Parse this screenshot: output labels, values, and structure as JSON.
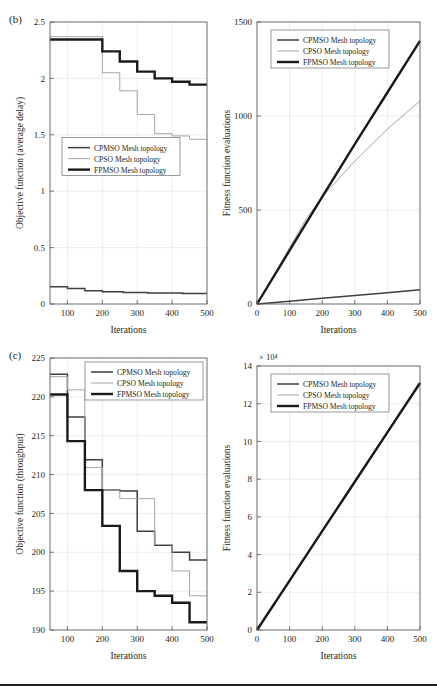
{
  "figure": {
    "panels": [
      {
        "id": "b",
        "label": "(b)",
        "charts": [
          "b-left",
          "b-right"
        ]
      },
      {
        "id": "c",
        "label": "(c)",
        "charts": [
          "c-left",
          "c-right"
        ]
      }
    ]
  },
  "series_styles": {
    "CPMSO Mesh topology": {
      "color": "#3f3f3f",
      "width": 1.5
    },
    "CPSO Mesh topology": {
      "color": "#a6a6a6",
      "width": 1.0
    },
    "FPMSO Mesh topology": {
      "color": "#1a1a1a",
      "width": 2.4
    }
  },
  "chart_data": [
    {
      "id": "b-left",
      "type": "line",
      "title": "",
      "panel": "(b)",
      "xlabel": "Iterations",
      "ylabel": "Objective function (average delay)",
      "xlim": [
        50,
        500
      ],
      "ylim": [
        0,
        2.5
      ],
      "xticks": [
        100,
        200,
        300,
        400,
        500
      ],
      "yticks": [
        0,
        0.5,
        1,
        1.5,
        2,
        2.5
      ],
      "ytick_labels": [
        "0",
        "0.5",
        "1",
        "1.5",
        "2",
        "2.5"
      ],
      "grid": true,
      "legend_position": "middle-left",
      "step": true,
      "series": [
        {
          "name": "CPMSO Mesh topology",
          "x": [
            50,
            100,
            100,
            150,
            150,
            200,
            200,
            260,
            260,
            330,
            330,
            430,
            430,
            500
          ],
          "y": [
            0.152,
            0.152,
            0.137,
            0.137,
            0.118,
            0.118,
            0.108,
            0.108,
            0.101,
            0.101,
            0.098,
            0.098,
            0.094,
            0.094
          ]
        },
        {
          "name": "CPSO Mesh topology",
          "x": [
            50,
            200,
            200,
            250,
            250,
            300,
            300,
            350,
            350,
            400,
            400,
            450,
            450,
            500
          ],
          "y": [
            2.37,
            2.37,
            2.05,
            2.05,
            1.89,
            1.89,
            1.68,
            1.68,
            1.51,
            1.51,
            1.49,
            1.49,
            1.46,
            1.46
          ],
          "start_y": 2.37
        },
        {
          "name": "FPMSO Mesh topology",
          "x": [
            50,
            200,
            200,
            250,
            250,
            300,
            300,
            350,
            350,
            400,
            400,
            450,
            450,
            500
          ],
          "y": [
            2.345,
            2.345,
            2.24,
            2.24,
            2.15,
            2.15,
            2.06,
            2.06,
            2.0,
            2.0,
            1.97,
            1.97,
            1.945,
            1.945
          ]
        }
      ]
    },
    {
      "id": "b-right",
      "type": "line",
      "title": "",
      "panel": "(b)",
      "xlabel": "Iterations",
      "ylabel": "Fitness function evaluations",
      "xlim": [
        0,
        500
      ],
      "ylim": [
        0,
        1500
      ],
      "xticks": [
        0,
        100,
        200,
        300,
        400,
        500
      ],
      "yticks": [
        0,
        500,
        1000,
        1500
      ],
      "ytick_labels": [
        "0",
        "500",
        "1000",
        "1500"
      ],
      "grid": true,
      "legend_position": "top-left",
      "step": false,
      "series": [
        {
          "name": "CPMSO Mesh topology",
          "x": [
            0,
            100,
            200,
            300,
            400,
            500
          ],
          "y": [
            0,
            15,
            30,
            45,
            60,
            76
          ]
        },
        {
          "name": "CPSO Mesh topology",
          "x": [
            0,
            100,
            150,
            200,
            300,
            400,
            500
          ],
          "y": [
            0,
            300,
            450,
            570,
            760,
            930,
            1080
          ]
        },
        {
          "name": "FPMSO Mesh topology",
          "x": [
            0,
            100,
            200,
            300,
            400,
            500
          ],
          "y": [
            0,
            285,
            570,
            850,
            1125,
            1400
          ]
        }
      ]
    },
    {
      "id": "c-left",
      "type": "line",
      "title": "",
      "panel": "(c)",
      "xlabel": "Iterations",
      "ylabel": "Objective function (throughput)",
      "xlim": [
        50,
        500
      ],
      "ylim": [
        190,
        225
      ],
      "xticks": [
        100,
        200,
        300,
        400,
        500
      ],
      "yticks": [
        190,
        195,
        200,
        205,
        210,
        215,
        220,
        225
      ],
      "ytick_labels": [
        "190",
        "195",
        "200",
        "205",
        "210",
        "215",
        "220",
        "225"
      ],
      "grid": true,
      "legend_position": "top-right",
      "step": true,
      "series": [
        {
          "name": "CPMSO Mesh topology",
          "x": [
            50,
            100,
            100,
            150,
            150,
            200,
            200,
            250,
            250,
            300,
            300,
            350,
            350,
            400,
            400,
            450,
            450,
            500
          ],
          "y": [
            222.9,
            222.9,
            217.4,
            217.4,
            211.9,
            211.9,
            208.0,
            208.0,
            207.9,
            207.9,
            202.7,
            202.7,
            200.9,
            200.9,
            200.0,
            200.0,
            199.0,
            199.0
          ]
        },
        {
          "name": "CPSO Mesh topology",
          "x": [
            50,
            100,
            100,
            150,
            150,
            200,
            200,
            250,
            250,
            350,
            350,
            400,
            400,
            450,
            450,
            500
          ],
          "y": [
            222.6,
            222.6,
            220.9,
            220.9,
            210.9,
            210.9,
            208.0,
            208.0,
            206.9,
            206.9,
            201.0,
            201.0,
            197.6,
            197.6,
            194.4,
            194.4
          ]
        },
        {
          "name": "FPMSO Mesh topology",
          "x": [
            50,
            100,
            100,
            150,
            150,
            200,
            200,
            250,
            250,
            300,
            300,
            350,
            350,
            400,
            400,
            450,
            450,
            500
          ],
          "y": [
            220.3,
            220.3,
            214.3,
            214.3,
            208.0,
            208.0,
            203.4,
            203.4,
            197.6,
            197.6,
            195.0,
            195.0,
            194.4,
            194.4,
            193.5,
            193.5,
            191.0,
            191.0
          ]
        }
      ]
    },
    {
      "id": "c-right",
      "type": "line",
      "title": "",
      "panel": "(c)",
      "xlabel": "Iterations",
      "ylabel": "Fitness function evaluations",
      "exponent_label": "× 10⁴",
      "xlim": [
        0,
        500
      ],
      "ylim": [
        0,
        14
      ],
      "xticks": [
        0,
        100,
        200,
        300,
        400,
        500
      ],
      "yticks": [
        0,
        2,
        4,
        6,
        8,
        10,
        12,
        14
      ],
      "ytick_labels": [
        "0",
        "2",
        "4",
        "6",
        "8",
        "10",
        "12",
        "14"
      ],
      "grid": true,
      "legend_position": "top-left",
      "step": false,
      "series": [
        {
          "name": "CPMSO Mesh topology",
          "x": [
            0,
            100,
            200,
            300,
            400,
            500
          ],
          "y": [
            0,
            2.62,
            5.24,
            7.86,
            10.48,
            13.1
          ]
        },
        {
          "name": "CPSO Mesh topology",
          "x": [
            0,
            100,
            200,
            300,
            400,
            500
          ],
          "y": [
            0,
            2.62,
            5.24,
            7.86,
            10.48,
            13.1
          ]
        },
        {
          "name": "FPMSO Mesh topology",
          "x": [
            0,
            100,
            200,
            300,
            400,
            500
          ],
          "y": [
            0,
            2.62,
            5.24,
            7.86,
            10.48,
            13.1
          ]
        }
      ]
    }
  ]
}
